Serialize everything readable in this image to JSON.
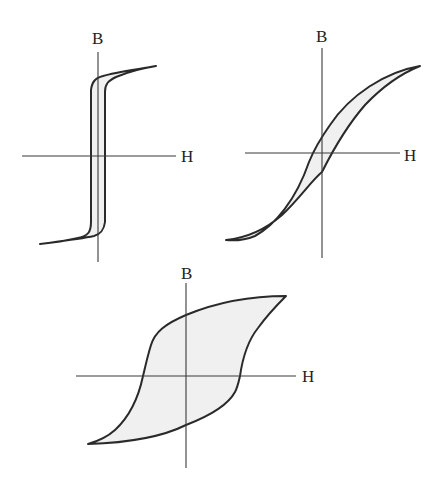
{
  "figure": {
    "panels": [
      {
        "id": "soft-narrow",
        "axis_x_label": "H",
        "axis_y_label": "B",
        "shape": "tall narrow square loop"
      },
      {
        "id": "medium",
        "axis_x_label": "H",
        "axis_y_label": "B",
        "shape": "narrow sigmoid loop"
      },
      {
        "id": "hard-wide",
        "axis_x_label": "H",
        "axis_y_label": "B",
        "shape": "wide loop"
      }
    ],
    "colors": {
      "stroke": "#2a2a2a",
      "fill": "#f0f0f0",
      "axis": "#3a3a3a"
    }
  }
}
